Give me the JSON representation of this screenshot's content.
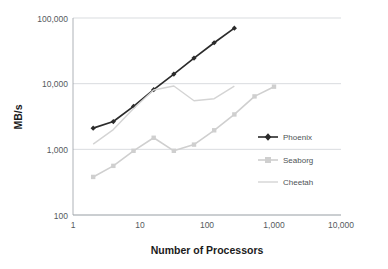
{
  "chart_data": {
    "type": "line",
    "title": "",
    "xlabel": "Number of Processors",
    "ylabel": "MB/s",
    "xscale": "log",
    "yscale": "log",
    "xlim": [
      1,
      10000
    ],
    "ylim": [
      100,
      100000
    ],
    "xticks": [
      1,
      10,
      100,
      1000,
      10000
    ],
    "xtick_labels": [
      "1",
      "10",
      "100",
      "1,000",
      "10,000"
    ],
    "yticks": [
      100,
      1000,
      10000,
      100000
    ],
    "ytick_labels": [
      "100",
      "1,000",
      "10,000",
      "100,000"
    ],
    "grid": "horizontal",
    "legend_position": "right-middle",
    "series": [
      {
        "name": "Phoenix",
        "color": "#2b2b2b",
        "marker": "diamond",
        "x": [
          2,
          4,
          8,
          16,
          32,
          64,
          128,
          256
        ],
        "y": [
          2100,
          2650,
          4500,
          8100,
          14000,
          24500,
          42000,
          70000
        ]
      },
      {
        "name": "Seaborg",
        "color": "#cfcfcf",
        "marker": "square",
        "x": [
          2,
          4,
          8,
          16,
          32,
          64,
          128,
          256,
          512,
          1000
        ],
        "y": [
          380,
          560,
          950,
          1500,
          950,
          1180,
          1950,
          3400,
          6400,
          9000
        ]
      },
      {
        "name": "Cheetah",
        "color": "#d4d4d4",
        "marker": "none",
        "x": [
          2,
          4,
          8,
          16,
          32,
          64,
          128,
          256
        ],
        "y": [
          1200,
          2000,
          4200,
          8000,
          9200,
          5500,
          5900,
          9200
        ]
      }
    ]
  },
  "axes": {
    "x_title": "Number of Processors",
    "y_title": "MB/s",
    "x_tick_1": "1",
    "x_tick_2": "10",
    "x_tick_3": "100",
    "x_tick_4": "1,000",
    "x_tick_5": "10,000",
    "y_tick_1": "100",
    "y_tick_2": "1,000",
    "y_tick_3": "10,000",
    "y_tick_4": "100,000"
  },
  "legend": {
    "items": [
      {
        "label": "Phoenix",
        "color": "#2b2b2b"
      },
      {
        "label": "Seaborg",
        "color": "#cfcfcf"
      },
      {
        "label": "Cheetah",
        "color": "#d4d4d4"
      }
    ]
  },
  "colors": {
    "phoenix": "#2b2b2b",
    "seaborg": "#cfcfcf",
    "cheetah": "#d4d4d4",
    "grid": "#c9cdd1",
    "axis": "#9aa0a5",
    "tick_text": "#555a5e",
    "title_text": "#1b1b1b",
    "background": "#ffffff"
  }
}
